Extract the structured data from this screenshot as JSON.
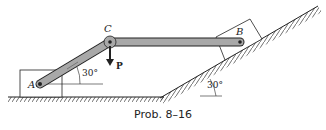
{
  "figure": {
    "caption": "Prob. 8–16",
    "labels": {
      "point_a": "A",
      "point_b": "B",
      "point_c": "C",
      "force": "P",
      "angle_link": "30°",
      "angle_incline": "30°"
    },
    "colors": {
      "link_fill": "#a8a8a8",
      "stroke": "#222222"
    }
  }
}
